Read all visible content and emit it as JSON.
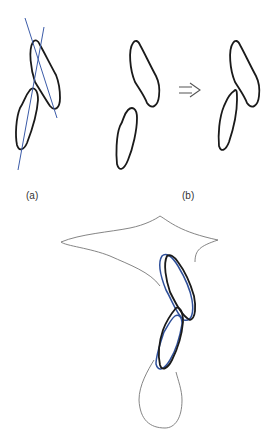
{
  "figure": {
    "panel_a_label": "(a)",
    "panel_b_label": "(b)",
    "arrow": "⇒",
    "colors": {
      "outline": "#1a1a1a",
      "axis_line": "#3b5ba8",
      "overlay": "#2e4f9a",
      "silhouette": "#777777"
    }
  }
}
